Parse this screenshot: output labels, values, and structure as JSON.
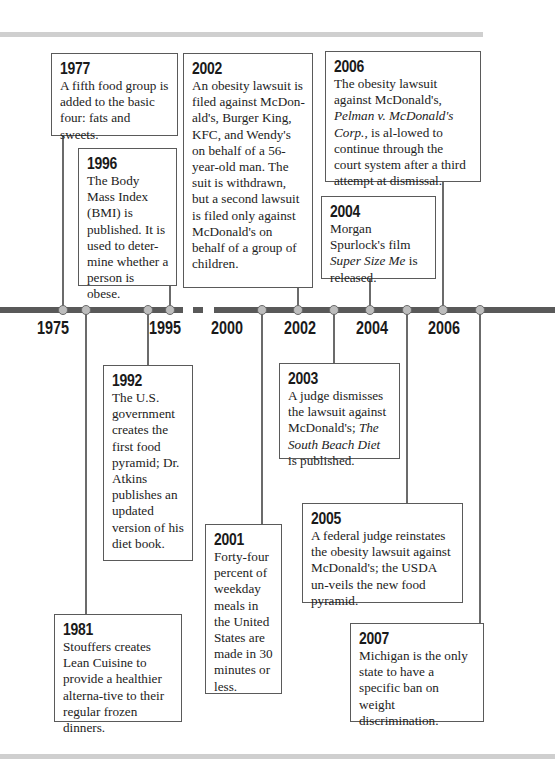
{
  "timeline": {
    "axis_labels": [
      "1975",
      "1995",
      "2000",
      "2002",
      "2004",
      "2006"
    ],
    "colors": {
      "line": "#595959",
      "dot_fill": "#bdbdbd",
      "box_border": "#5a5a5a",
      "rule": "#cfcfcf"
    }
  },
  "events": {
    "e1977": {
      "year": "1977",
      "text": "A fifth food group is added to the basic four: fats and sweets."
    },
    "e1996": {
      "year": "1996",
      "text": "The Body Mass Index (BMI) is published. It is used to deter-mine whether a person is obese."
    },
    "e2002": {
      "year": "2002",
      "text": "An obesity lawsuit is filed against McDon-ald's, Burger King, KFC, and Wendy's on behalf of a 56-year-old man. The suit is withdrawn, but a second lawsuit is filed only against McDonald's on behalf of a group of children."
    },
    "e2006": {
      "year": "2006",
      "text_a": "The obesity lawsuit against McDonald's, ",
      "text_italic": "Pelman v. McDonald's Corp.",
      "text_b": ", is al-lowed to continue through the court system after a third attempt at dismissal."
    },
    "e2004": {
      "year": "2004",
      "text_a": "Morgan Spurlock's film ",
      "text_italic": "Super Size Me",
      "text_b": " is released."
    },
    "e1992": {
      "year": "1992",
      "text": "The U.S. government creates the first food pyramid; Dr. Atkins publishes an updated version of his diet book."
    },
    "e2003": {
      "year": "2003",
      "text_a": "A judge dismisses the lawsuit against McDonald's; ",
      "text_italic": "The South Beach Diet",
      "text_b": " is published."
    },
    "e2005": {
      "year": "2005",
      "text": "A federal judge reinstates the obesity lawsuit against McDonald's; the USDA un-veils the new food pyramid."
    },
    "e2001": {
      "year": "2001",
      "text": "Forty-four percent of weekday meals in the United States are made in 30 minutes or less."
    },
    "e1981": {
      "year": "1981",
      "text": "Stouffers creates Lean Cuisine to provide a healthier alterna-tive to their regular frozen dinners."
    },
    "e2007": {
      "year": "2007",
      "text": "Michigan is the only state to have a specific ban on weight discrimination."
    }
  }
}
